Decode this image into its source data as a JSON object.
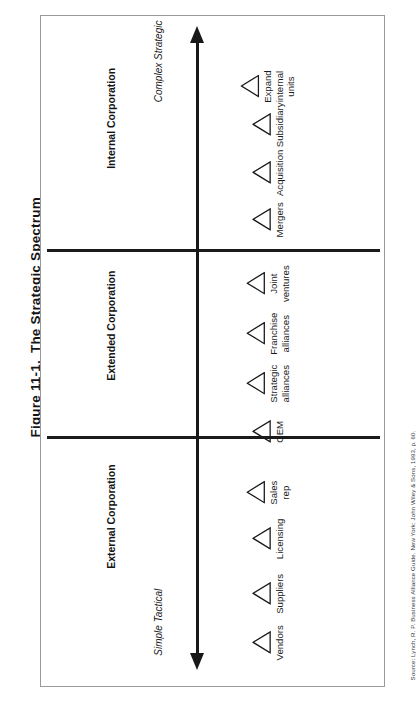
{
  "figure": {
    "number": "Figure 11-1.",
    "title": "The Strategic Spectrum",
    "source": "Source: Lynch, R. P. Business Alliance Guide. New York: John Wiley & Sons, 1993, p. 60."
  },
  "axis": {
    "orientation": "vertical",
    "arrow": "double-headed",
    "top_label": "Complex\nStrategic",
    "bottom_label": "Simple\nTactical"
  },
  "bands": [
    {
      "id": "external",
      "label": "External\nCorporation"
    },
    {
      "id": "extended",
      "label": "Extended\nCorporation"
    },
    {
      "id": "internal",
      "label": "Internal\nCorporation"
    }
  ],
  "items": [
    {
      "label": "Vendors",
      "band": "external"
    },
    {
      "label": "Suppliers",
      "band": "external"
    },
    {
      "label": "Licensing",
      "band": "external"
    },
    {
      "label": "Sales\nrep",
      "band": "external"
    },
    {
      "label": "OEM",
      "band": "external"
    },
    {
      "label": "Strategic\nalliances",
      "band": "extended"
    },
    {
      "label": "Franchise\nalliances",
      "band": "extended"
    },
    {
      "label": "Joint\nventures",
      "band": "extended"
    },
    {
      "label": "Mergers",
      "band": "internal"
    },
    {
      "label": "Acquisition",
      "band": "internal"
    },
    {
      "label": "Subsidiary",
      "band": "internal"
    },
    {
      "label": "Expand\ninternal\nunits",
      "band": "internal"
    }
  ],
  "colors": {
    "ink": "#141414",
    "frame": "#9a9a9a",
    "rule": "#1a1a1a",
    "page": "#ffffff"
  }
}
